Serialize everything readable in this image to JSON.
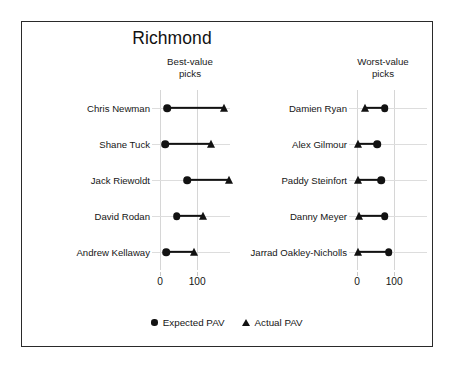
{
  "chart_data": {
    "type": "scatter",
    "subtype": "dumbbell",
    "title": "Richmond",
    "xlabel": "",
    "ylabel": "",
    "xlim": [
      -18,
      200
    ],
    "xticks": [
      0,
      100
    ],
    "xticklabels": [
      "0",
      "100"
    ],
    "grid": "vertical-light",
    "legend": {
      "position": "bottom-center",
      "entries": [
        {
          "label": "Expected PAV",
          "marker": "circle"
        },
        {
          "label": "Actual PAV",
          "marker": "triangle"
        }
      ]
    },
    "panels": [
      {
        "key": "best",
        "heading": "Best-value\npicks",
        "heading_line1": "Best-value",
        "heading_line2": "picks",
        "categories": [
          "Chris Newman",
          "Shane Tuck",
          "Jack Riewoldt",
          "David Rodan",
          "Andrew Kellaway"
        ],
        "series": [
          {
            "name": "Expected PAV",
            "marker": "circle",
            "values": [
              20,
              14,
              73,
              45,
              16
            ]
          },
          {
            "name": "Actual PAV",
            "marker": "triangle",
            "values": [
              172,
              136,
              186,
              115,
              92
            ]
          }
        ]
      },
      {
        "key": "worst",
        "heading": "Worst-value\npicks",
        "heading_line1": "Worst-value",
        "heading_line2": "picks",
        "categories": [
          "Damien Ryan",
          "Alex Gilmour",
          "Paddy Steinfort",
          "Danny Meyer",
          "Jarrad Oakley-Nicholls"
        ],
        "series": [
          {
            "name": "Expected PAV",
            "marker": "circle",
            "values": [
              75,
              55,
              65,
              75,
              85
            ]
          },
          {
            "name": "Actual PAV",
            "marker": "triangle",
            "values": [
              22,
              2,
              3,
              5,
              2
            ]
          }
        ]
      }
    ]
  },
  "colors": {
    "marker": "#121212",
    "connector": "#121212",
    "gridline": "#d6d6d6",
    "border": "#2a2a2a",
    "background": "#ffffff",
    "text": "#151515"
  }
}
